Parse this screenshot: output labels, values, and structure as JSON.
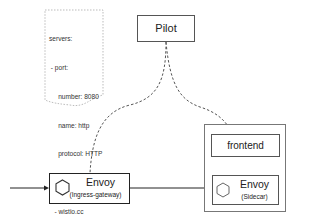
{
  "config_doc": {
    "lines": [
      "servers:",
      " - port:",
      "     number: 8080",
      "     name: http",
      "     protocol: HTTP",
      "   hosts:",
      "   - wistio.cc"
    ]
  },
  "nodes": {
    "pilot": {
      "label": "Pilot"
    },
    "gateway": {
      "title": "Envoy",
      "subtitle": "(Ingress-gateway)"
    },
    "frontend": {
      "label": "frontend"
    },
    "sidecar": {
      "title": "Envoy",
      "subtitle": "(Sidecar)"
    }
  },
  "colors": {
    "line": "#222222",
    "border": "#555555",
    "dashed": "#555555"
  }
}
